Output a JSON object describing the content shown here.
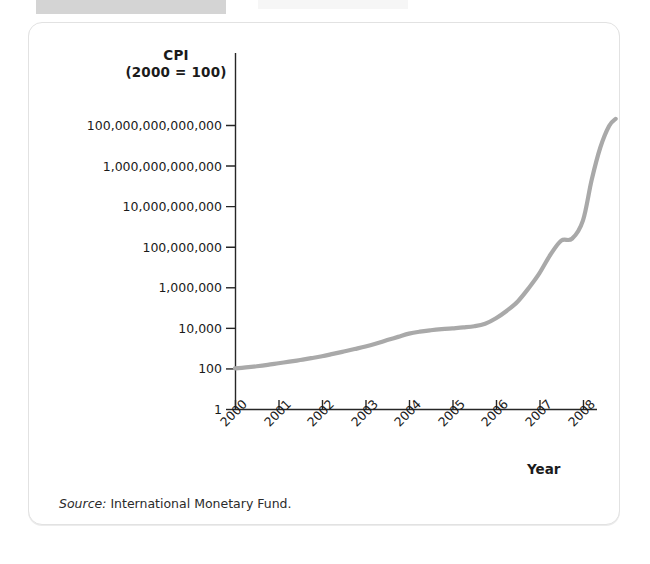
{
  "figure": {
    "source_note_label": "Source:",
    "source_note_text": " International Monetary Fund.",
    "y_axis_title_line1": "CPI",
    "y_axis_title_line2": "(2000 = 100)",
    "x_axis_title": "Year",
    "line_color": "#a9a9a9",
    "axis_color": "#262626",
    "card_background": "#ffffff",
    "card_border_color": "#e2e2e2"
  },
  "chart_data": {
    "type": "line",
    "title": "",
    "subtitle": "",
    "xlabel": "Year",
    "ylabel": "CPI (2000 = 100)",
    "yscale": "log",
    "ylim": [
      1,
      1000000000000000
    ],
    "xlim": [
      2000,
      2008.7
    ],
    "grid": false,
    "legend": null,
    "ytick_labels": [
      "100,000,000,000,000",
      "1,000,000,000,000",
      "10,000,000,000",
      "100,000,000",
      "1,000,000",
      "10,000",
      "100",
      "1"
    ],
    "ytick_values": [
      100000000000000,
      1000000000000,
      10000000000,
      100000000,
      1000000,
      10000,
      100,
      1
    ],
    "xtick_labels": [
      "2000",
      "2001",
      "2002",
      "2003",
      "2004",
      "2005",
      "2006",
      "2007",
      "2008"
    ],
    "xtick_values": [
      2000,
      2001,
      2002,
      2003,
      2004,
      2005,
      2006,
      2007,
      2008
    ],
    "series": [
      {
        "name": "Zimbabwe CPI",
        "x": [
          2000.0,
          2000.25,
          2000.5,
          2000.75,
          2001.0,
          2001.25,
          2001.5,
          2001.75,
          2002.0,
          2002.25,
          2002.5,
          2002.75,
          2003.0,
          2003.25,
          2003.5,
          2003.75,
          2004.0,
          2004.25,
          2004.5,
          2004.75,
          2005.0,
          2005.25,
          2005.5,
          2005.75,
          2006.0,
          2006.25,
          2006.5,
          2006.75,
          2007.0,
          2007.25,
          2007.5,
          2007.75,
          2008.0,
          2008.2,
          2008.4,
          2008.6,
          2008.75
        ],
        "y": [
          100,
          112,
          128,
          150,
          180,
          215,
          260,
          320,
          400,
          520,
          680,
          900,
          1200,
          1700,
          2500,
          3600,
          5200,
          6500,
          7600,
          8600,
          9500,
          10500,
          12000,
          16000,
          30000,
          70000,
          200000,
          900000,
          5000000,
          40000000,
          200000000,
          250000000,
          2000000000,
          200000000000,
          8000000000000,
          90000000000000,
          200000000000000
        ]
      }
    ]
  }
}
